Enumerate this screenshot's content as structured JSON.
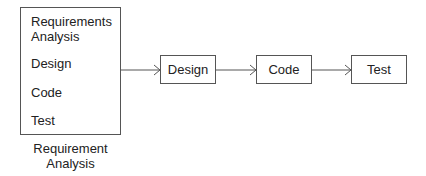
{
  "diagram": {
    "stack_box": {
      "items": [
        "Requirements",
        "Analysis",
        "Design",
        "Code",
        "Test"
      ]
    },
    "caption": [
      "Requirement",
      "Analysis"
    ],
    "steps": [
      {
        "label": "Design"
      },
      {
        "label": "Code"
      },
      {
        "label": "Test"
      }
    ],
    "colors": {
      "line": "#555555",
      "text": "#222222",
      "background": "#ffffff"
    }
  }
}
